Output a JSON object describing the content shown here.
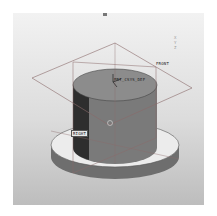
{
  "viewport": {
    "background_top": "#f2f2f2",
    "background_bottom": "#bdbdbd",
    "model_color": "#7a7a7a",
    "datum_plane_color": "#8a6a6a"
  },
  "datums": {
    "plane_top_label": "FRONT",
    "plane_left_label": "RIGHT",
    "csys_label": "PRT_CSYS_DEF"
  },
  "orientation_triad": {
    "axes": [
      "X",
      "Y",
      "Z"
    ]
  }
}
